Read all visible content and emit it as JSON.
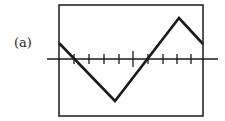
{
  "figure": {
    "label": "(a)",
    "waveform": "triangle",
    "colors": {
      "line": "#1a1a1a",
      "background": "#ffffff"
    }
  },
  "frame": {
    "x": 59,
    "y": 5,
    "width": 144,
    "height": 111
  },
  "axis": {
    "y": 59,
    "x_start": 47,
    "x_end": 218
  },
  "ticks": {
    "short": [
      74,
      89,
      104,
      119,
      148,
      163,
      177,
      191
    ],
    "long": [
      133
    ],
    "short_half": 5,
    "long_half": 8
  },
  "wave_points": [
    [
      59,
      43
    ],
    [
      115,
      101
    ],
    [
      179,
      18
    ],
    [
      203,
      44
    ]
  ]
}
